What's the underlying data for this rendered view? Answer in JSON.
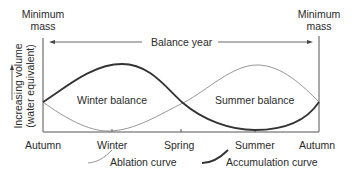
{
  "diagram": {
    "top_labels": {
      "left_minimum": [
        "Minimum",
        "mass"
      ],
      "right_minimum": [
        "Minimum",
        "mass"
      ],
      "balance_year": "Balance year"
    },
    "y_axis_label": [
      "Increasing volume",
      "(water equivalent)"
    ],
    "x_axis_labels": [
      "Autumn",
      "Winter",
      "Spring",
      "Summer",
      "Autumn"
    ],
    "regions": {
      "winter": "Winter balance",
      "summer": "Summer balance"
    },
    "legend": {
      "ablation": "Ablation curve",
      "accumulation": "Accumulation curve"
    },
    "curves": [
      {
        "name": "Accumulation curve",
        "style": "thick",
        "color": "#333333",
        "shape": "rises from Autumn to peak in Winter, falls through Spring, minimum in Summer, rises to Autumn"
      },
      {
        "name": "Ablation curve",
        "style": "thin",
        "color": "#888888",
        "shape": "falls from Autumn to minimum in Winter, rises through Spring, peak in Summer, falls to Autumn"
      }
    ]
  }
}
